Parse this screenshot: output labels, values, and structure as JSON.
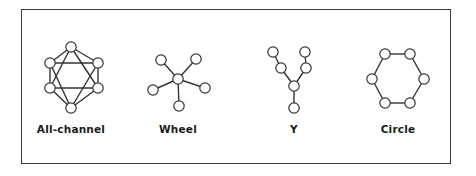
{
  "diagram": {
    "stroke_color": "#333333",
    "node_fill": "#ffffff",
    "networks": [
      {
        "id": "all-channel",
        "label": "All-channel",
        "nodes": [
          [
            71,
            47
          ],
          [
            50,
            63
          ],
          [
            98,
            63
          ],
          [
            50,
            88
          ],
          [
            98,
            88
          ],
          [
            71,
            108
          ]
        ],
        "edges": [
          [
            0,
            1
          ],
          [
            0,
            2
          ],
          [
            1,
            3
          ],
          [
            2,
            4
          ],
          [
            3,
            5
          ],
          [
            4,
            5
          ],
          [
            1,
            2
          ],
          [
            3,
            4
          ],
          [
            0,
            3
          ],
          [
            0,
            4
          ],
          [
            1,
            5
          ],
          [
            2,
            5
          ]
        ]
      },
      {
        "id": "wheel",
        "label": "Wheel",
        "nodes": [
          [
            178,
            79
          ],
          [
            161,
            60
          ],
          [
            196,
            59
          ],
          [
            153,
            90
          ],
          [
            205,
            88
          ],
          [
            179,
            106
          ]
        ],
        "edges": [
          [
            0,
            1
          ],
          [
            0,
            2
          ],
          [
            0,
            3
          ],
          [
            0,
            4
          ],
          [
            0,
            5
          ]
        ]
      },
      {
        "id": "y",
        "label": "Y",
        "nodes": [
          [
            273,
            52
          ],
          [
            281,
            68
          ],
          [
            305,
            52
          ],
          [
            306,
            68
          ],
          [
            294,
            86
          ],
          [
            294,
            108
          ]
        ],
        "edges": [
          [
            0,
            1
          ],
          [
            1,
            4
          ],
          [
            2,
            3
          ],
          [
            3,
            4
          ],
          [
            4,
            5
          ]
        ]
      },
      {
        "id": "circle",
        "label": "Circle",
        "nodes": [
          [
            385,
            54
          ],
          [
            410,
            54
          ],
          [
            372,
            79
          ],
          [
            424,
            79
          ],
          [
            385,
            103
          ],
          [
            410,
            103
          ]
        ],
        "edges": [
          [
            0,
            1
          ],
          [
            1,
            3
          ],
          [
            3,
            5
          ],
          [
            5,
            4
          ],
          [
            4,
            2
          ],
          [
            2,
            0
          ]
        ]
      }
    ]
  }
}
